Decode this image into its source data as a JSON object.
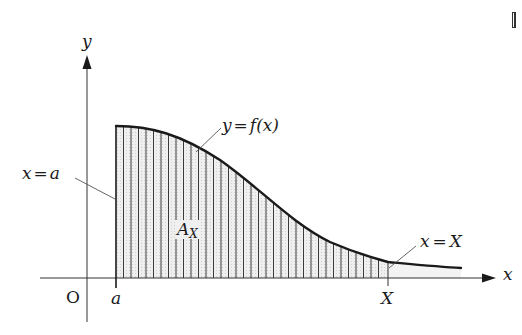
{
  "diagram": {
    "type": "area-under-curve",
    "axes": {
      "x_label": "x",
      "y_label": "y",
      "origin_label": "O"
    },
    "curve": {
      "label": "y = f(x)",
      "lhs": "y",
      "eq": "=",
      "rhs": "f(x)"
    },
    "boundaries": {
      "left_line": {
        "label": "x = a",
        "var": "x",
        "eq": "=",
        "val": "a"
      },
      "right_line": {
        "label": "x = X",
        "var": "x",
        "eq": "=",
        "val": "X"
      }
    },
    "ticks": {
      "a": "a",
      "X": "X"
    },
    "region": {
      "label_main": "A",
      "label_sub": "X",
      "fill_color": "#e6e6e6",
      "hatch_color": "#3a3a3a"
    },
    "colors": {
      "stroke": "#1a1a1a",
      "leader": "#555555"
    }
  }
}
